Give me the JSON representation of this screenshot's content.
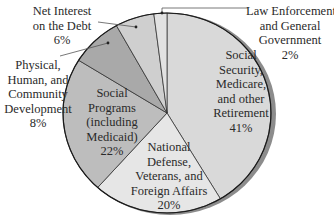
{
  "chart_data": {
    "type": "pie",
    "title": "",
    "start_angle_deg": 0,
    "direction": "clockwise",
    "slices": [
      {
        "label": "Social Security, Medicare, and other Retirement",
        "value": 41,
        "color": "#d9d9d9"
      },
      {
        "label": "National Defense, Veterans, and Foreign Affairs",
        "value": 20,
        "color": "#e6e6e6"
      },
      {
        "label": "Social Programs (including Medicaid)",
        "value": 22,
        "color": "#bdbdbd"
      },
      {
        "label": "Physical, Human, and Community Development",
        "value": 8,
        "color": "#a9a9a9"
      },
      {
        "label": "Net Interest on the Debt",
        "value": 6,
        "color": "#cfcfcf"
      },
      {
        "label": "Law Enforcement and General Government",
        "value": 2,
        "color": "#e2e2e2"
      }
    ],
    "unit": "%"
  },
  "labels": {
    "social_security": {
      "lines": [
        "Social",
        "Security,",
        "Medicare,",
        "and other",
        "Retirement"
      ],
      "pct": "41%"
    },
    "national_defense": {
      "lines": [
        "National",
        "Defense,",
        "Veterans, and",
        "Foreign Affairs"
      ],
      "pct": "20%"
    },
    "social_programs": {
      "lines": [
        "Social",
        "Programs",
        "(including",
        "Medicaid)"
      ],
      "pct": "22%"
    },
    "physical_human": {
      "lines": [
        "Physical,",
        "Human, and",
        "Community",
        "Development"
      ],
      "pct": "8%"
    },
    "net_interest": {
      "lines": [
        "Net Interest",
        "on the Debt"
      ],
      "pct": "6%"
    },
    "law_enforcement": {
      "lines": [
        "Law Enforcement",
        "and General",
        "Government"
      ],
      "pct": "2%"
    }
  }
}
